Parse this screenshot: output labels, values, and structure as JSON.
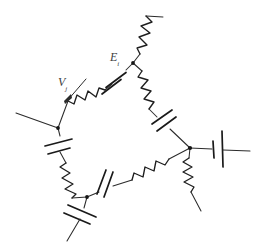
{
  "figure": {
    "kind": "hand-drawn-circuit-diagram",
    "width": 260,
    "height": 249,
    "background_color": "#ffffff",
    "ink_color": "#2b2b2b"
  },
  "labels": {
    "voltage": {
      "symbol": "V",
      "subscript": "j",
      "full": "Vj",
      "x": 58,
      "y": 76,
      "has_arrow": true,
      "arrow_direction": "down-left"
    },
    "emf": {
      "symbol": "E",
      "subscript": "i",
      "full": "Ei",
      "x": 110,
      "y": 51,
      "has_arrow": false
    }
  },
  "nodes": [
    {
      "id": "n-top",
      "name": "top-node",
      "x": 133,
      "y": 63
    },
    {
      "id": "n-left",
      "name": "left-node",
      "x": 58,
      "y": 128
    },
    {
      "id": "n-right",
      "name": "right-node",
      "x": 190,
      "y": 148
    },
    {
      "id": "n-bottom-left",
      "name": "bottom-left-node",
      "x": 87,
      "y": 197
    }
  ],
  "terminals": [
    {
      "id": "t-top-right",
      "name": "top-right-terminal",
      "x": 162,
      "y": 17
    },
    {
      "id": "t-left",
      "name": "left-terminal",
      "x": 16,
      "y": 113
    },
    {
      "id": "t-far-right",
      "name": "far-right-terminal",
      "x": 250,
      "y": 150
    },
    {
      "id": "t-bottom-right",
      "name": "bottom-right-terminal",
      "x": 201,
      "y": 210
    },
    {
      "id": "t-bottom-left",
      "name": "bottom-left-terminal",
      "x": 66,
      "y": 240
    }
  ],
  "branches": [
    {
      "id": "b-top-left",
      "name": "branch-top-node-to-left-node",
      "from": "n-top",
      "to": "n-left",
      "elements": [
        "capacitor",
        "resistor"
      ]
    },
    {
      "id": "b-top-right",
      "name": "branch-top-node-to-right-node",
      "from": "n-top",
      "to": "n-right",
      "elements": [
        "resistor",
        "capacitor"
      ]
    },
    {
      "id": "b-bottom",
      "name": "branch-bottom-left-node-to-right-node",
      "from": "n-bottom-left",
      "to": "n-right",
      "elements": [
        "capacitor",
        "resistor"
      ]
    },
    {
      "id": "b-left",
      "name": "branch-left-node-to-bottom-left-node",
      "from": "n-left",
      "to": "n-bottom-left",
      "elements": [
        "capacitor",
        "resistor"
      ]
    },
    {
      "id": "b-stub-top",
      "name": "stub-top-node-resistor",
      "from": "n-top",
      "to": "t-top-right",
      "elements": [
        "resistor"
      ]
    },
    {
      "id": "b-stub-left",
      "name": "stub-left-node-wire",
      "from": "n-left",
      "to": "t-left",
      "elements": []
    },
    {
      "id": "b-stub-right",
      "name": "stub-right-node-battery",
      "from": "n-right",
      "to": "t-far-right",
      "elements": [
        "battery"
      ]
    },
    {
      "id": "b-stub-right-down",
      "name": "stub-right-node-resistor",
      "from": "n-right",
      "to": "t-bottom-right",
      "elements": [
        "resistor"
      ]
    },
    {
      "id": "b-stub-bottom-left",
      "name": "stub-bottom-left-node-capacitor",
      "from": "n-bottom-left",
      "to": "t-bottom-left",
      "elements": [
        "capacitor"
      ]
    }
  ],
  "element_counts": {
    "resistors": 6,
    "capacitors": 6,
    "batteries": 1,
    "nodes": 4
  }
}
